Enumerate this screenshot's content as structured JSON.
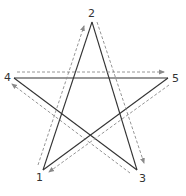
{
  "diagram": {
    "type": "pentagram-stroke-order",
    "vertices": [
      {
        "id": "1",
        "label": "1",
        "x": 43,
        "y": 170,
        "lx": 36,
        "ly": 181
      },
      {
        "id": "2",
        "label": "2",
        "x": 92,
        "y": 22,
        "lx": 88,
        "ly": 17
      },
      {
        "id": "3",
        "label": "3",
        "x": 137,
        "y": 170,
        "lx": 139,
        "ly": 182
      },
      {
        "id": "4",
        "label": "4",
        "x": 14,
        "y": 78,
        "lx": 4,
        "ly": 81
      },
      {
        "id": "5",
        "label": "5",
        "x": 168,
        "y": 78,
        "lx": 172,
        "ly": 82
      }
    ],
    "stroke_order": [
      "1",
      "2",
      "3",
      "4",
      "5",
      "1"
    ],
    "dashed_arrows": [
      {
        "from": "1",
        "to": "2",
        "x1": 38,
        "y1": 165,
        "x2": 84,
        "y2": 26
      },
      {
        "from": "2",
        "to": "3",
        "x1": 97,
        "y1": 22,
        "x2": 144,
        "y2": 163
      },
      {
        "from": "3",
        "to": "4",
        "x1": 130,
        "y1": 173,
        "x2": 12,
        "y2": 84
      },
      {
        "from": "4",
        "to": "5",
        "x1": 17,
        "y1": 72,
        "x2": 164,
        "y2": 72
      },
      {
        "from": "5",
        "to": "1",
        "x1": 169,
        "y1": 85,
        "x2": 49,
        "y2": 172
      }
    ],
    "colors": {
      "solid": "#333333",
      "dashed": "#8a8a8a",
      "label": "#333333"
    }
  }
}
